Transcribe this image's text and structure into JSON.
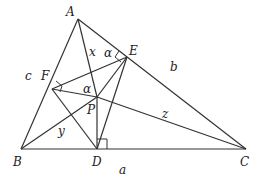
{
  "diagram": {
    "points": {
      "A": {
        "label": "A",
        "x": 78,
        "y": 19
      },
      "B": {
        "label": "B",
        "x": 21,
        "y": 149
      },
      "C": {
        "label": "C",
        "x": 246,
        "y": 149
      },
      "D": {
        "label": "D",
        "x": 97,
        "y": 149
      },
      "E": {
        "label": "E",
        "x": 127,
        "y": 57
      },
      "F": {
        "label": "F",
        "x": 52,
        "y": 89
      },
      "P": {
        "label": "P",
        "x": 97,
        "y": 97
      }
    },
    "side_labels": {
      "a": "a",
      "b": "b",
      "c": "c"
    },
    "segment_labels": {
      "x": "x",
      "y": "y",
      "z": "z"
    },
    "angle_labels": {
      "alpha_E": "α",
      "alpha_P": "α"
    },
    "right_angles": [
      "D",
      "E",
      "F"
    ]
  }
}
